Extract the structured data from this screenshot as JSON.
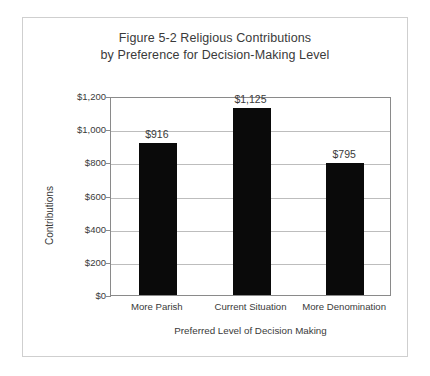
{
  "figure": {
    "title_line1": "Figure 5-2 Religious Contributions",
    "title_line2": "by Preference for Decision-Making Level",
    "border_color": "#cfcfcf",
    "background_color": "#ffffff"
  },
  "chart_data": {
    "type": "bar",
    "title": "Figure 5-2 Religious Contributions by Preference for Decision-Making Level",
    "categories": [
      "More Parish",
      "Current Situation",
      "More Denomination"
    ],
    "values": [
      916,
      1125,
      795
    ],
    "value_labels": [
      "$916",
      "$1,125",
      "$795"
    ],
    "xlabel": "Preferred Level of Decision Making",
    "ylabel": "Contributions",
    "ylim": [
      0,
      1200
    ],
    "ytick_values": [
      0,
      200,
      400,
      600,
      800,
      1000,
      1200
    ],
    "ytick_labels": [
      "$0",
      "$200",
      "$400",
      "$600",
      "$800",
      "$1,000",
      "$1,200"
    ],
    "grid": true,
    "grid_axis": "y",
    "legend": false,
    "bar_color": "#0a0a0a",
    "gridline_color": "#bdbdbd",
    "axis_color": "#8a8a8a",
    "text_color": "#3a3a3a"
  }
}
